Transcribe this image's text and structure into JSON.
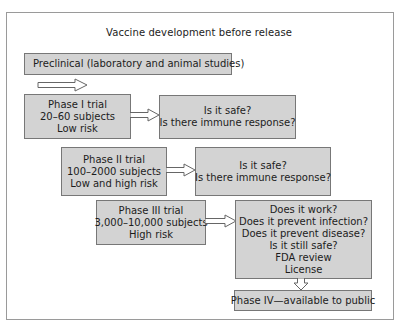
{
  "diagram": {
    "title": "Vaccine development before release",
    "preclinical": {
      "label": "Preclinical (laboratory and animal studies)"
    },
    "phase1": {
      "lines": [
        "Phase I trial",
        "20–60 subjects",
        "Low risk"
      ],
      "questions": [
        "Is it safe?",
        "Is there immune response?"
      ]
    },
    "phase2": {
      "lines": [
        "Phase II trial",
        "100–2000 subjects",
        "Low and high risk"
      ],
      "questions": [
        "Is it safe?",
        "Is there immune response?"
      ]
    },
    "phase3": {
      "lines": [
        "Phase III trial",
        "3,000–10,000 subjects",
        "High risk"
      ],
      "questions": [
        "Does it work?",
        "Does it prevent infection?",
        "Does it prevent disease?",
        "Is it still safe?",
        "FDA review",
        "License"
      ]
    },
    "phase4": {
      "label": "Phase IV—available to public"
    },
    "colors": {
      "box_fill": "#d3d3d3",
      "box_border": "#777777",
      "frame_border": "#9a9a9a",
      "arrow_stroke": "#666666"
    },
    "icons": {
      "flow_arrow": "right-arrow-icon",
      "down_arrow": "down-arrow-icon"
    }
  }
}
